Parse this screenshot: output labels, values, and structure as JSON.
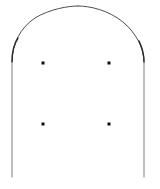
{
  "figure": {
    "canvas": {
      "width": 160,
      "height": 189,
      "background_color": "#ffffff"
    },
    "stroke": {
      "arch_color": "#3a3a3a",
      "jamb_color": "#8a8a8a",
      "shoulder_color": "#2a2a2a",
      "arch_width": 0.9,
      "jamb_width": 1.1,
      "shoulder_width": 1.4
    },
    "dots": {
      "color": "#0d0d0d",
      "size": 3,
      "count": 4,
      "points": [
        {
          "name": "dot-top-left",
          "x": 43,
          "y": 63
        },
        {
          "name": "dot-top-right",
          "x": 109,
          "y": 63
        },
        {
          "name": "dot-bottom-left",
          "x": 43,
          "y": 124
        },
        {
          "name": "dot-bottom-right",
          "x": 109,
          "y": 124
        }
      ]
    },
    "geometry": {
      "apex": {
        "x": 78,
        "y": 6
      },
      "left_springline": {
        "x": 12,
        "y": 62
      },
      "right_springline": {
        "x": 144,
        "y": 62
      },
      "left_jamb_bottom": {
        "x": 12,
        "y": 177
      },
      "right_jamb_bottom": {
        "x": 144,
        "y": 177
      },
      "left_arch_path": "M 12 62 C 12 44 20 28 35 18 C 50 9 68 6 78 6",
      "right_arch_path": "M 78 6 C 90 6 108 10 123 22 C 136 33 144 48 144 62",
      "left_jamb_path": "M 12 62 L 12 177",
      "right_jamb_path": "M 144 62 L 144 177",
      "left_shoulder_path": "M 12 62 C 12 52 14 44 18 38",
      "right_shoulder_path": "M 144 62 C 144 54 142 47 139 41"
    }
  }
}
